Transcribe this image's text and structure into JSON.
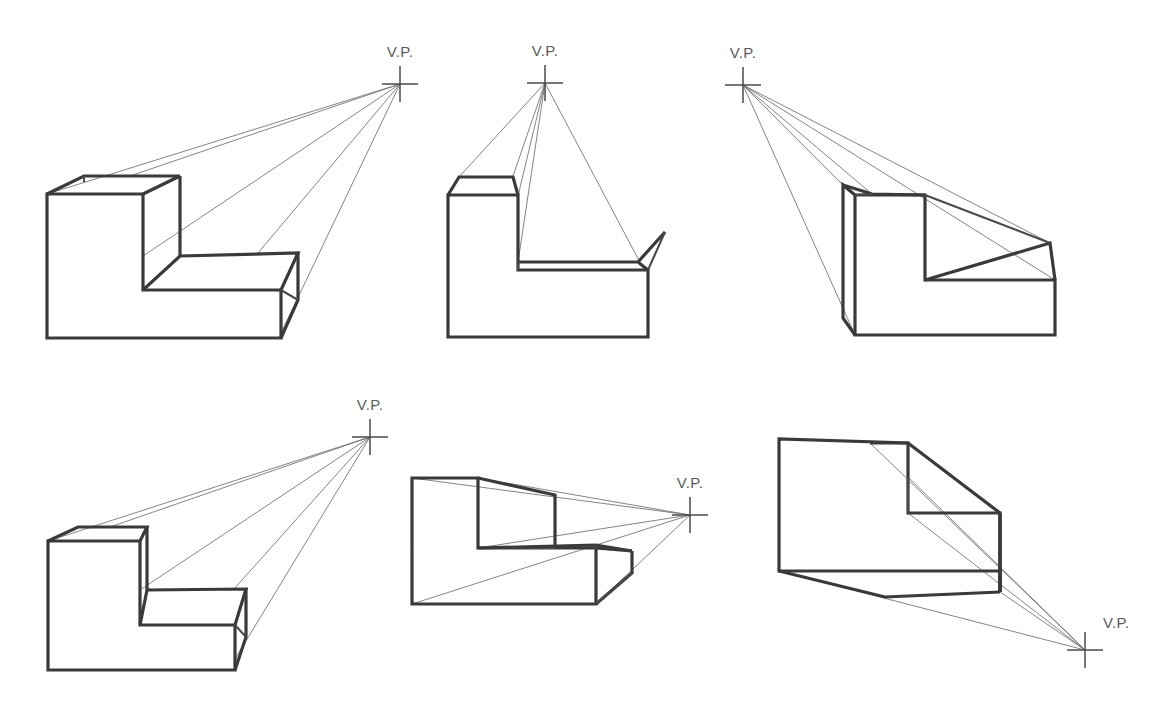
{
  "page": {
    "background_color": "#ffffff",
    "line_color": "#3a3a3a",
    "projection_line_color": "#6e6e6e",
    "label_color": "#5a5a5a"
  },
  "figures": [
    {
      "id": "figure-1",
      "row": 1,
      "column": 1,
      "vp_label": "V.P.",
      "vp_position": {
        "x": 400,
        "y": 84
      },
      "vp_label_position": {
        "x": 400,
        "y": 57
      },
      "vp_label_anchor": "middle",
      "vp_direction": "upper-right",
      "object": "L-shaped block, front-left face visible, depth receding right and up",
      "description": "Vanishing point far to the upper right; long shallow convergence."
    },
    {
      "id": "figure-2",
      "row": 1,
      "column": 2,
      "vp_label": "V.P.",
      "vp_position": {
        "x": 545,
        "y": 83
      },
      "vp_label_position": {
        "x": 545,
        "y": 56
      },
      "vp_label_anchor": "middle",
      "vp_direction": "directly-above",
      "object": "L-shaped block seen from the front, depth receding upward",
      "description": "Vanishing point directly above the object; narrow triangular convergence."
    },
    {
      "id": "figure-3",
      "row": 1,
      "column": 3,
      "vp_label": "V.P.",
      "vp_position": {
        "x": 743,
        "y": 85
      },
      "vp_label_position": {
        "x": 743,
        "y": 58
      },
      "vp_label_anchor": "middle",
      "vp_direction": "upper-left",
      "object": "L-shaped block, right face visible, depth receding left and up",
      "description": "Vanishing point to the upper left; object mirrored from figure 1."
    },
    {
      "id": "figure-4",
      "row": 2,
      "column": 1,
      "vp_label": "V.P.",
      "vp_position": {
        "x": 370,
        "y": 437
      },
      "vp_label_position": {
        "x": 370,
        "y": 410
      },
      "vp_label_anchor": "middle",
      "vp_direction": "upper-right",
      "object": "L-shaped block, front-left face visible, shallower depth",
      "description": "Vanishing point closer to the object than figure 1; steeper convergence."
    },
    {
      "id": "figure-5",
      "row": 2,
      "column": 2,
      "vp_label": "V.P.",
      "vp_position": {
        "x": 690,
        "y": 515
      },
      "vp_label_position": {
        "x": 690,
        "y": 488
      },
      "vp_label_anchor": "middle",
      "vp_direction": "right-eye-level",
      "object": "L-shaped block with depth receding horizontally right",
      "description": "Vanishing point near object eye level; top and bottom faces both visible."
    },
    {
      "id": "figure-6",
      "row": 2,
      "column": 3,
      "vp_label": "V.P.",
      "vp_position": {
        "x": 1085,
        "y": 650
      },
      "vp_label_position": {
        "x": 1103,
        "y": 628
      },
      "vp_label_anchor": "start",
      "vp_direction": "lower-right",
      "object": "L-shaped block seen from below, depth receding right and down",
      "description": "Vanishing point to the lower right; worm's-eye view showing underside."
    }
  ]
}
